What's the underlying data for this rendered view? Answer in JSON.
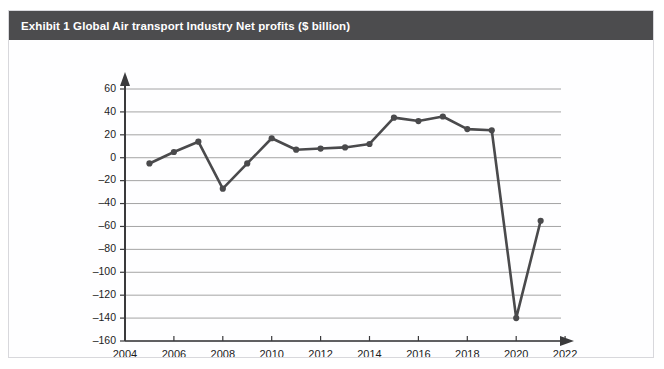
{
  "exhibit": {
    "title": "Exhibit 1  Global Air transport Industry Net profits ($ billion)",
    "header_color": "#4c4c4e",
    "frame_border_color": "#d8d8dc",
    "background_color": "#fefeff"
  },
  "chart_data": {
    "type": "line",
    "title": "Exhibit 1  Global Air transport Industry Net profits ($ billion)",
    "xlabel": "",
    "ylabel": "",
    "x": [
      2005,
      2006,
      2007,
      2008,
      2009,
      2010,
      2011,
      2012,
      2013,
      2014,
      2015,
      2016,
      2017,
      2018,
      2019,
      2020,
      2021
    ],
    "values": [
      -5,
      5,
      14,
      -27,
      -5,
      17,
      7,
      8,
      9,
      12,
      35,
      32,
      36,
      25,
      24,
      -140,
      -55
    ],
    "series": [
      {
        "name": "Net profits ($ billion)",
        "values": [
          -5,
          5,
          14,
          -27,
          -5,
          17,
          7,
          8,
          9,
          12,
          35,
          32,
          36,
          25,
          24,
          -140,
          -55
        ]
      }
    ],
    "xlim": [
      2004,
      2022
    ],
    "ylim": [
      -160,
      60
    ],
    "xticks": [
      2004,
      2006,
      2008,
      2010,
      2012,
      2014,
      2016,
      2018,
      2020,
      2022
    ],
    "xtick_labels": [
      "2004",
      "2006",
      "2008",
      "2010",
      "2012",
      "2014",
      "2016",
      "2018",
      "2020",
      "2022"
    ],
    "yticks": [
      60,
      40,
      20,
      0,
      -20,
      -40,
      -60,
      -80,
      -100,
      -120,
      -140,
      -160
    ],
    "ytick_labels": [
      "60",
      "40",
      "20",
      "0",
      "–20",
      "–40",
      "–60",
      "–80",
      "–100",
      "–120",
      "–140",
      "–160"
    ],
    "grid": true,
    "grid_axis": "y",
    "grid_color": "#9a9a9a",
    "line_color": "#4a4a4c",
    "marker_color": "#4a4a4c",
    "marker": "circle",
    "legend": false,
    "legend_position": "none",
    "annotations": []
  }
}
